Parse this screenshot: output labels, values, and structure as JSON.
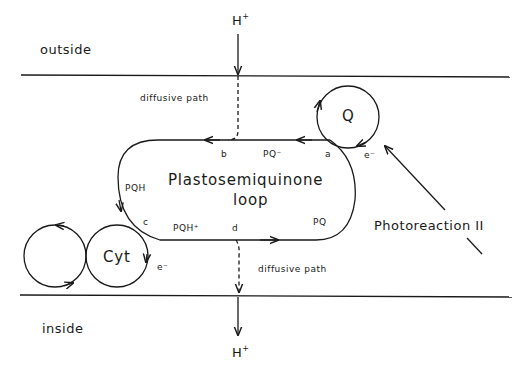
{
  "diagram": {
    "regions": {
      "outside": "outside",
      "inside": "inside"
    },
    "proton_top": "H",
    "proton_bottom": "H",
    "proton_charge": "+",
    "diffusive_path_top": "diffusive path",
    "diffusive_path_bottom": "diffusive path",
    "loop_title_line1": "Plastosemiquinone",
    "loop_title_line2": "loop",
    "points": {
      "a": "a",
      "b": "b",
      "c": "c",
      "d": "d"
    },
    "species": {
      "pq_minus": "PQ⁻",
      "pqh": "PQH",
      "pqh_plus": "PQH⁺",
      "pq": "PQ"
    },
    "q_label": "Q",
    "cyt_label": "Cyt",
    "electron_q": "e⁻",
    "electron_cyt": "e⁻",
    "photoreaction": "Photoreaction II",
    "colors": {
      "line": "#1a1a1a",
      "background": "#ffffff"
    }
  }
}
